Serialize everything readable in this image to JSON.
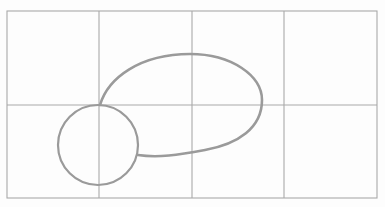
{
  "figure": {
    "type": "pencil-sketch-on-grid",
    "colors": {
      "background": "#fdfdfd",
      "grid": "#a9a9a9",
      "stroke": "#9a9a9a"
    },
    "grid": {
      "left": 7,
      "top": 11,
      "right": 377,
      "bottom": 198,
      "columns": 4,
      "rows": 2,
      "vertical_lines": [
        99,
        192,
        284
      ],
      "horizontal_lines": [
        105
      ]
    },
    "shapes": {
      "circle": {
        "cx": 98,
        "cy": 145,
        "r": 40
      },
      "blob": {
        "description": "large rounded egg-shaped loop attached to the top and right of the circle"
      }
    }
  }
}
